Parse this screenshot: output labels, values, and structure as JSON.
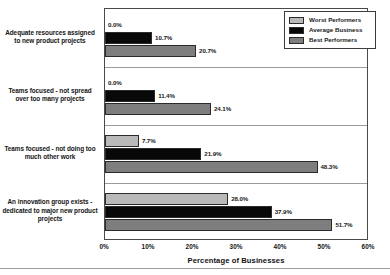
{
  "chart_data": {
    "type": "bar",
    "orientation": "horizontal",
    "title": "",
    "xlabel": "Percentage of Businesses",
    "ylabel": "",
    "xlim": [
      0,
      60
    ],
    "xticks": [
      "0%",
      "10%",
      "20%",
      "30%",
      "40%",
      "50%",
      "60%"
    ],
    "xtick_values": [
      0,
      10,
      20,
      30,
      40,
      50,
      60
    ],
    "grid": false,
    "legend_position": "top-right-inside",
    "categories": [
      "Adequate resources assigned to new product projects",
      "Teams focused - not spread over too many projects",
      "Teams focused - not doing too much other work",
      "An innovation group exists - dedicated to major new product projects"
    ],
    "series": [
      {
        "name": "Worst Performers",
        "color": "#b9b9b9",
        "values": [
          0.0,
          0.0,
          7.7,
          28.0
        ],
        "labels": [
          "0.0%",
          "0.0%",
          "7.7%",
          "28.0%"
        ]
      },
      {
        "name": "Average Business",
        "color": "#080808",
        "values": [
          10.7,
          11.4,
          21.9,
          37.9
        ],
        "labels": [
          "10.7%",
          "11.4%",
          "21.9%",
          "37.9%"
        ]
      },
      {
        "name": "Best Performers",
        "color": "#7e7e7e",
        "values": [
          20.7,
          24.1,
          48.3,
          51.7
        ],
        "labels": [
          "20.7%",
          "24.1%",
          "48.3%",
          "51.7%"
        ]
      }
    ]
  },
  "legend": {
    "items": [
      {
        "label": "Worst Performers",
        "swatch": "worst"
      },
      {
        "label": "Average Business",
        "swatch": "average"
      },
      {
        "label": "Best Performers",
        "swatch": "best"
      }
    ]
  },
  "axis": {
    "x_title": "Percentage of Businesses"
  }
}
